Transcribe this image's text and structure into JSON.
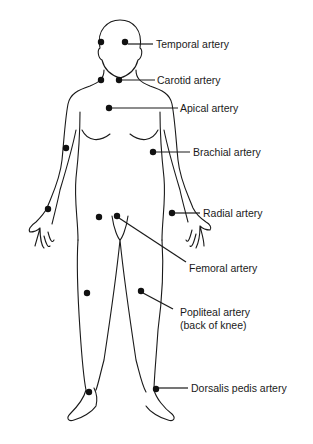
{
  "diagram": {
    "labels": {
      "temporal": "Temporal artery",
      "carotid": "Carotid artery",
      "apical": "Apical artery",
      "brachial": "Brachial artery",
      "radial": "Radial artery",
      "femoral": "Femoral artery",
      "popliteal_line1": "Popliteal artery",
      "popliteal_line2": "(back of knee)",
      "dorsalis": "Dorsalis pedis artery"
    },
    "colors": {
      "ink": "#1a1a1a",
      "background": "#ffffff"
    }
  }
}
